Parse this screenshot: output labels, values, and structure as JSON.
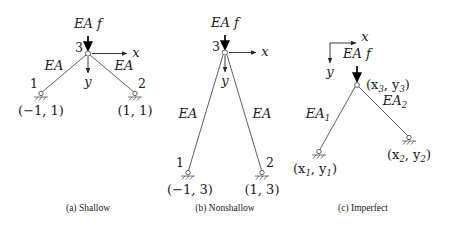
{
  "figure": {
    "background_color": "#ffffff",
    "line_color": "#4d4d4d",
    "text_color": "#1a1a1a"
  },
  "panels": [
    {
      "id": "shallow",
      "caption": "(a) Shallow",
      "load_label": "EA f",
      "apex_node_label": "3",
      "axis_x_label": "x",
      "axis_y_label": "y",
      "left_member_label": "EA",
      "right_member_label": "EA",
      "left_node_label": "1",
      "right_node_label": "2",
      "left_coord_label": "(−1, 1)",
      "right_coord_label": "(1, 1)"
    },
    {
      "id": "nonshallow",
      "caption": "(b) Nonshallow",
      "load_label": "EA f",
      "apex_node_label": "3",
      "axis_x_label": "x",
      "axis_y_label": "y",
      "left_member_label": "EA",
      "right_member_label": "EA",
      "left_node_label": "1",
      "right_node_label": "2",
      "left_coord_label": "(−1, 3)",
      "right_coord_label": "(1, 3)"
    },
    {
      "id": "imperfect",
      "caption": "(c) Imperfect",
      "load_label": "EA f",
      "axis_x_label": "x",
      "axis_y_label": "y",
      "left_member_label": "EA",
      "left_member_sub": "1",
      "right_member_label": "EA",
      "right_member_sub": "2",
      "apex_coord_prefix": "(x",
      "apex_coord_sub1": "3",
      "apex_coord_mid": ", y",
      "apex_coord_sub2": "3",
      "apex_coord_suffix": ")",
      "left_coord_prefix": "(x",
      "left_coord_sub1": "1",
      "left_coord_mid": ", y",
      "left_coord_sub2": "1",
      "left_coord_suffix": ")",
      "right_coord_prefix": "(x",
      "right_coord_sub1": "2",
      "right_coord_mid": ", y",
      "right_coord_sub2": "2",
      "right_coord_suffix": ")"
    }
  ]
}
